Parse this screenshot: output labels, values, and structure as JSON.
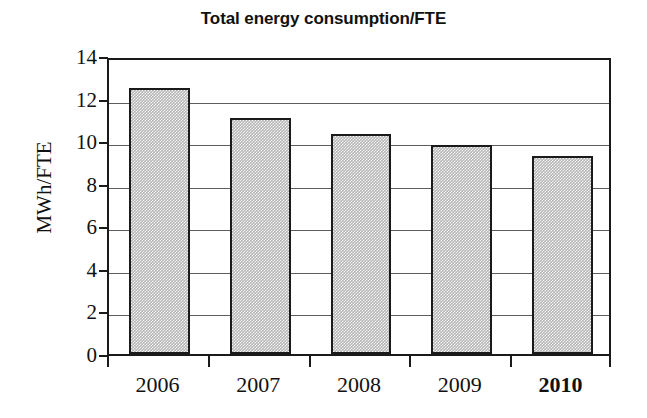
{
  "chart_data": {
    "type": "bar",
    "title": "Total energy consumption/FTE",
    "xlabel": "",
    "ylabel": "MWh/FTE",
    "categories": [
      "2006",
      "2007",
      "2008",
      "2009",
      "2010"
    ],
    "values": [
      12.5,
      11.1,
      10.35,
      9.8,
      9.3
    ],
    "series": [
      {
        "name": "Total energy consumption/FTE",
        "values": [
          12.5,
          11.1,
          10.35,
          9.8,
          9.3
        ]
      }
    ],
    "ylim": [
      0,
      14
    ],
    "ytick_step": 2,
    "ytick_labels": [
      "14",
      "12",
      "10",
      "8",
      "6",
      "4",
      "2",
      "0"
    ],
    "ytick_values": [
      14,
      12,
      10,
      8,
      6,
      4,
      2,
      0
    ],
    "grid": true,
    "grid_axis": "y",
    "legend": "none",
    "emphasized_category": "2010",
    "bar_fill_color": "#b4b4b4",
    "bar_border_color": "#1a1a1a",
    "axis_color": "#1a1a1a",
    "grid_color": "#5d5d5d",
    "background_color": "#ffffff"
  }
}
